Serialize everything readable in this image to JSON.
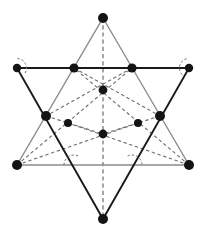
{
  "figure": {
    "canvas": {
      "width": 206,
      "height": 239
    },
    "colors": {
      "background": "#ffffff",
      "solid_dark": "#1a1a1a",
      "solid_light": "#8c8c8c",
      "dashed": "#6e6e6e",
      "dot_fill": "#141414"
    },
    "points": {
      "top_apex": {
        "label": "",
        "x": 103,
        "y": 18,
        "r": 5.0
      },
      "bottom_apex": {
        "label": "",
        "x": 103,
        "y": 219,
        "r": 5.0
      },
      "upper_left": {
        "label": "",
        "x": 17,
        "y": 68,
        "r": 4.2
      },
      "upper_right": {
        "label": "",
        "x": 189,
        "y": 68,
        "r": 4.2
      },
      "lower_left": {
        "label": "",
        "x": 17,
        "y": 165,
        "r": 5.0
      },
      "lower_right": {
        "label": "",
        "x": 189,
        "y": 165,
        "r": 5.0
      },
      "cross_top_left": {
        "label": "",
        "x": 74,
        "y": 68,
        "r": 4.6
      },
      "cross_top_right": {
        "label": "",
        "x": 132,
        "y": 68,
        "r": 4.6
      },
      "cross_mid_left": {
        "label": "",
        "x": 46,
        "y": 116,
        "r": 5.0
      },
      "cross_mid_right": {
        "label": "",
        "x": 160,
        "y": 116,
        "r": 5.0
      },
      "inner_top": {
        "label": "",
        "x": 103,
        "y": 90,
        "r": 4.4
      },
      "inner_bottom": {
        "label": "",
        "x": 103,
        "y": 134,
        "r": 4.4
      },
      "inner_left": {
        "label": "",
        "x": 68,
        "y": 123,
        "r": 4.0
      },
      "inner_right": {
        "label": "",
        "x": 138,
        "y": 123,
        "r": 4.0
      }
    },
    "shapes": {
      "down_triangle": {
        "name": "downward-pointing-triangle",
        "stroke_style": "solid_dark",
        "path": "M 17 68 L 189 68 L 103 219 Z"
      },
      "up_triangle": {
        "name": "upward-pointing-triangle",
        "stroke_style": "solid_light",
        "path": "M 103 18 L 189 165 L 17 165 Z"
      }
    },
    "dashed_segments": [
      {
        "name": "vertical-axis",
        "path": "M 103 18 L 103 219"
      },
      {
        "name": "upper-left-to-inner-right",
        "path": "M 74 68 L 160 116"
      },
      {
        "name": "upper-right-to-inner-left",
        "path": "M 132 68 L 46 116"
      },
      {
        "name": "lowerleft-to-upperright",
        "path": "M 17 165 L 132 68"
      },
      {
        "name": "lowerright-to-upperleft",
        "path": "M 189 165 L 74 68"
      },
      {
        "name": "inner-hex-left-chord",
        "path": "M 46 116 L 103 134"
      },
      {
        "name": "inner-hex-right-chord",
        "path": "M 160 116 L 103 134"
      },
      {
        "name": "lowerleft-to-innerright",
        "path": "M 17 165 L 138 123"
      },
      {
        "name": "lowerright-to-innerleft",
        "path": "M 189 165 L 68 123"
      }
    ],
    "angle_arcs": [
      {
        "name": "angle-arc-upper-left",
        "cx": 17,
        "cy": 68,
        "r": 9.5,
        "start_deg": -88,
        "end_deg": 44
      },
      {
        "name": "angle-arc-upper-right",
        "cx": 189,
        "cy": 68,
        "r": 9.5,
        "start_deg": 136,
        "end_deg": 268
      },
      {
        "name": "angle-arc-lower-left",
        "cx": 74,
        "cy": 165,
        "r": 10.0,
        "start_deg": 180,
        "end_deg": 296
      },
      {
        "name": "angle-arc-lower-right",
        "cx": 132,
        "cy": 165,
        "r": 10.0,
        "start_deg": 244,
        "end_deg": 360
      }
    ]
  },
  "chart_data": {
    "type": "diagram",
    "figures": [
      {
        "name": "downward-pointing-triangle",
        "vertices": [
          [
            17,
            68
          ],
          [
            189,
            68
          ],
          [
            103,
            219
          ]
        ],
        "style": "solid dark"
      },
      {
        "name": "upward-pointing-triangle",
        "vertices": [
          [
            103,
            18
          ],
          [
            189,
            165
          ],
          [
            17,
            165
          ]
        ],
        "style": "solid light gray"
      }
    ],
    "marked_points": [
      [
        103,
        18
      ],
      [
        17,
        68
      ],
      [
        74,
        68
      ],
      [
        132,
        68
      ],
      [
        189,
        68
      ],
      [
        46,
        116
      ],
      [
        160,
        116
      ],
      [
        103,
        90
      ],
      [
        68,
        123
      ],
      [
        138,
        123
      ],
      [
        103,
        134
      ],
      [
        17,
        165
      ],
      [
        189,
        165
      ],
      [
        103,
        219
      ]
    ],
    "point_count": 14,
    "angle_marker_count": 4,
    "dashed_line_count": 9
  }
}
